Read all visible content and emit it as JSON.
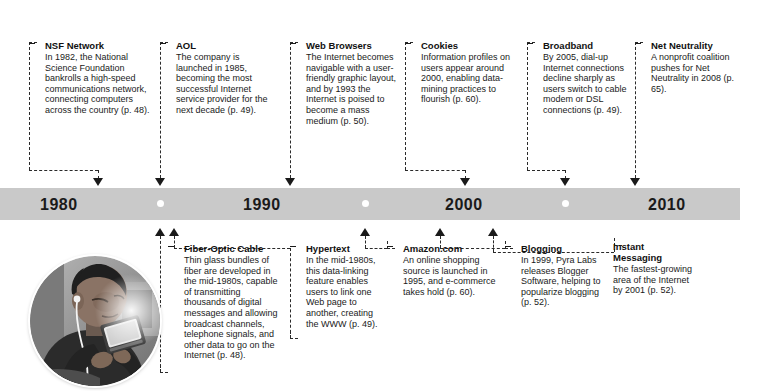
{
  "timeline": {
    "decades": [
      {
        "label": "1980",
        "x": 40
      },
      {
        "label": "1990",
        "x": 243
      },
      {
        "label": "2000",
        "x": 445
      },
      {
        "label": "2010",
        "x": 648
      }
    ],
    "dots_x": [
      160,
      365,
      565
    ],
    "bar_color": "#c9c9c9"
  },
  "photo": {
    "alt_name": "teen-with-handheld-device-photo",
    "description": "Young man wearing earbuds looking down at a handheld device"
  },
  "top_entries": [
    {
      "id": "nsf-network",
      "title": "NSF Network",
      "body": "In 1982, the National Science Foundation bankrolls a high-speed communications network, connecting computers across the country (p. 48)."
    },
    {
      "id": "aol",
      "title": "AOL",
      "body": "The company is launched in 1985, becoming the most successful Internet service provider for the next decade (p. 49)."
    },
    {
      "id": "web-browsers",
      "title": "Web Browsers",
      "body": "The Internet becomes navigable with a user-friendly graphic layout, and by 1993 the Internet is poised to become a mass medium (p. 50)."
    },
    {
      "id": "cookies",
      "title": "Cookies",
      "body": "Information profiles on users appear around 2000, enabling data-mining practices to flourish (p. 60)."
    },
    {
      "id": "broadband",
      "title": "Broadband",
      "body": "By 2005, dial-up Internet connections decline sharply as users switch to cable modem or DSL connections (p. 49)."
    },
    {
      "id": "net-neutrality",
      "title": "Net Neutrality",
      "body": "A nonprofit coalition pushes for Net Neutrality in 2008 (p. 65)."
    }
  ],
  "bottom_entries": [
    {
      "id": "fiber-optic-cable",
      "title": "Fiber-Optic Cable",
      "body": "Thin glass bundles of fiber are developed in the mid-1980s, capable of transmitting thousands of digital messages and allowing broadcast channels, telephone signals, and other data to go on the Internet (p. 48)."
    },
    {
      "id": "hypertext",
      "title": "Hypertext",
      "body": "In the mid-1980s, this data-linking feature enables users to link one Web page to another, creating the WWW (p. 49)."
    },
    {
      "id": "amazon-com",
      "title": "Amazon.com",
      "body": "An online shopping source is launched in 1995, and e-commerce takes hold (p. 60)."
    },
    {
      "id": "blogging",
      "title": "Blogging",
      "body": "In 1999, Pyra Labs releases Blogger Software, helping to popularize blogging (p. 52)."
    },
    {
      "id": "instant-messaging",
      "title": "Instant Messaging",
      "body": "The fastest-growing area of the Internet by 2001 (p. 52)."
    }
  ]
}
